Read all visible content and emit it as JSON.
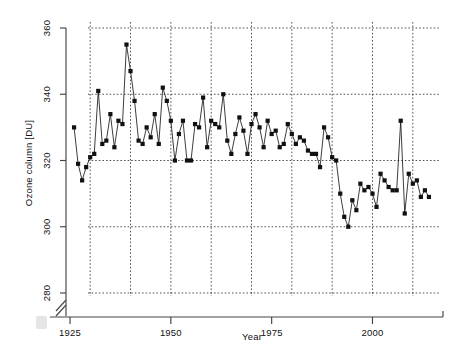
{
  "figure": {
    "background_color": "#ffffff",
    "ink_color": "#1a1a1a",
    "grid_color": "#222222"
  },
  "chart_data": {
    "type": "line",
    "title": "",
    "subtitle": "",
    "xlabel": "Year",
    "ylabel": "Ozone column [DU]",
    "xlim": [
      1924,
      2016
    ],
    "ylim": [
      276,
      364
    ],
    "y_axis_break": true,
    "y_axis_break_note": "axis break between baseline and 280",
    "grid": true,
    "grid_x_major_step": 10,
    "grid_y_major_step": 20,
    "legend": null,
    "legend_position": "none",
    "marker": "square",
    "xticks": [
      1925,
      1950,
      1975,
      2000
    ],
    "xtick_labels": [
      "1925",
      "1950",
      "1975",
      "2000"
    ],
    "yticks": [
      280,
      300,
      320,
      340,
      360
    ],
    "ytick_labels": [
      "280",
      "300",
      "320",
      "340",
      "360"
    ],
    "x_gridlines": [
      1930,
      1940,
      1950,
      1960,
      1970,
      1980,
      1990,
      2000,
      2010
    ],
    "y_gridlines": [
      280,
      300,
      320,
      340,
      360
    ],
    "series": [
      {
        "name": "Ozone column",
        "x": [
          1926,
          1927,
          1928,
          1929,
          1930,
          1931,
          1932,
          1933,
          1934,
          1935,
          1936,
          1937,
          1938,
          1939,
          1940,
          1941,
          1942,
          1943,
          1944,
          1945,
          1946,
          1947,
          1948,
          1949,
          1950,
          1951,
          1952,
          1953,
          1954,
          1955,
          1956,
          1957,
          1958,
          1959,
          1960,
          1961,
          1962,
          1963,
          1964,
          1965,
          1966,
          1967,
          1968,
          1969,
          1970,
          1971,
          1972,
          1973,
          1974,
          1975,
          1976,
          1977,
          1978,
          1979,
          1980,
          1981,
          1982,
          1983,
          1984,
          1985,
          1986,
          1987,
          1988,
          1989,
          1990,
          1991,
          1992,
          1993,
          1994,
          1995,
          1996,
          1997,
          1998,
          1999,
          2000,
          2001,
          2002,
          2003,
          2004,
          2005,
          2006,
          2007,
          2008,
          2009,
          2010,
          2011,
          2012,
          2013,
          2014
        ],
        "y": [
          330,
          319,
          314,
          318,
          321,
          322,
          341,
          325,
          326,
          334,
          324,
          332,
          331,
          355,
          347,
          338,
          326,
          325,
          330,
          327,
          334,
          325,
          342,
          338,
          332,
          320,
          328,
          332,
          320,
          320,
          331,
          330,
          339,
          324,
          332,
          331,
          330,
          340,
          326,
          322,
          328,
          333,
          329,
          322,
          331,
          334,
          330,
          324,
          332,
          328,
          329,
          324,
          325,
          331,
          328,
          325,
          327,
          326,
          323,
          322,
          322,
          318,
          330,
          327,
          321,
          320,
          310,
          303,
          300,
          308,
          305,
          313,
          311,
          312,
          310,
          306,
          316,
          314,
          312,
          311,
          311,
          332,
          304,
          316,
          313,
          314,
          309,
          311,
          309
        ]
      }
    ]
  },
  "axes": {
    "y_title": "Ozone column [DU]",
    "x_title": "Year"
  }
}
